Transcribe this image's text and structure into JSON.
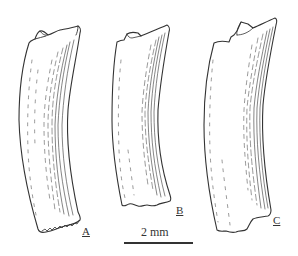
{
  "figure": {
    "specimens": [
      {
        "id": "A",
        "label": "A"
      },
      {
        "id": "B",
        "label": "B"
      },
      {
        "id": "C",
        "label": "C"
      }
    ],
    "scale_bar": {
      "label": "2 mm"
    },
    "colors": {
      "ink": "#333333",
      "background": "#ffffff"
    }
  }
}
